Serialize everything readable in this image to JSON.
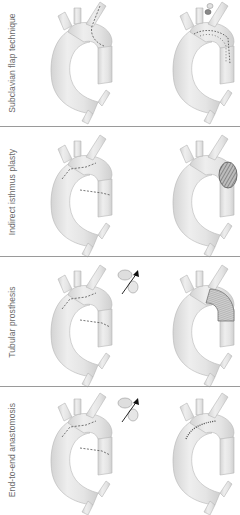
{
  "figure": {
    "panels": [
      {
        "label": "Subclavian flap technique",
        "before": "aorta-with-subclavian-incision",
        "after": "aorta-with-subclavian-flap-sutured",
        "inset": "scissors-icon"
      },
      {
        "label": "Indirect isthmus plasty",
        "before": "aorta-with-isthmus-incision",
        "after": "aorta-with-patch-plasty",
        "inset": ""
      },
      {
        "label": "Tubular prosthesis",
        "before": "aorta-with-resection-lines",
        "after": "aorta-with-tube-graft",
        "inset": "resected-segment-arrow-icon"
      },
      {
        "label": "End-to-end anastomosis",
        "before": "aorta-with-resection-lines",
        "after": "aorta-with-end-to-end-suture",
        "inset": "resected-segment-arrow-icon"
      }
    ],
    "colors": {
      "vessel_fill": "#e6e6e6",
      "vessel_stroke": "#b5b5b5",
      "suture": "#555555",
      "divider": "#9a9a9a",
      "label_text": "#6a6a6a"
    }
  }
}
